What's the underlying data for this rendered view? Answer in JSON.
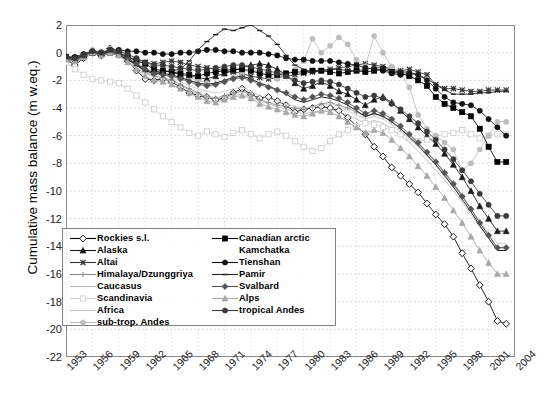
{
  "chart_data": {
    "type": "line",
    "title": "",
    "xlabel": "",
    "ylabel": "Cumulative mass balance (m w.eq.)",
    "xlim": [
      1953,
      2004
    ],
    "ylim": [
      -22,
      2
    ],
    "ytick_step": 2,
    "xtick_step": 3,
    "grid": true,
    "legend_position": "inside-lower-left",
    "xticks": [
      "1953",
      "1956",
      "1959",
      "1962",
      "1965",
      "1968",
      "1971",
      "1974",
      "1977",
      "1980",
      "1983",
      "1986",
      "1989",
      "1992",
      "1995",
      "1998",
      "2001",
      "2004"
    ],
    "yticks": [
      "2",
      "0",
      "-2",
      "-4",
      "-6",
      "-8",
      "-10",
      "-12",
      "-14",
      "-16",
      "-18",
      "-20",
      "-22"
    ],
    "x": [
      1953,
      1954,
      1955,
      1956,
      1957,
      1958,
      1959,
      1960,
      1961,
      1962,
      1963,
      1964,
      1965,
      1966,
      1967,
      1968,
      1969,
      1970,
      1971,
      1972,
      1973,
      1974,
      1975,
      1976,
      1977,
      1978,
      1979,
      1980,
      1981,
      1982,
      1983,
      1984,
      1985,
      1986,
      1987,
      1988,
      1989,
      1990,
      1991,
      1992,
      1993,
      1994,
      1995,
      1996,
      1997,
      1998,
      1999,
      2000,
      2001,
      2002,
      2003
    ],
    "series": [
      {
        "name": "Rockies s.l.",
        "marker": "diamond-open",
        "color": "#000000",
        "fill": "#ffffff",
        "values": [
          -0.5,
          -0.9,
          -0.4,
          0.1,
          -0.2,
          0.3,
          0.1,
          -0.6,
          -1.3,
          -1.9,
          -2.0,
          -1.9,
          -2.1,
          -2.5,
          -2.9,
          -3.1,
          -3.2,
          -3.4,
          -3.3,
          -2.9,
          -2.6,
          -3.0,
          -3.3,
          -3.2,
          -3.5,
          -3.8,
          -4.3,
          -4.1,
          -4.0,
          -3.9,
          -4.0,
          -4.2,
          -4.7,
          -5.3,
          -5.9,
          -6.8,
          -7.5,
          -8.3,
          -8.9,
          -9.5,
          -10.1,
          -10.9,
          -11.7,
          -12.4,
          -13.3,
          -14.5,
          -15.6,
          -16.8,
          -18.0,
          -19.4,
          -19.6
        ]
      },
      {
        "name": "Alaska",
        "marker": "triangle",
        "color": "#1a1a1a",
        "fill": "#1a1a1a",
        "values": [
          -0.3,
          -0.4,
          -0.2,
          0.0,
          -0.1,
          0.0,
          -0.1,
          -0.4,
          -0.8,
          -1.2,
          -1.4,
          -1.3,
          -1.4,
          -1.6,
          -1.7,
          -1.8,
          -1.9,
          -1.7,
          -1.5,
          -1.3,
          -1.1,
          -0.9,
          -0.8,
          -0.9,
          -1.2,
          -1.6,
          -2.2,
          -2.6,
          -2.4,
          -2.1,
          -2.4,
          -2.8,
          -3.0,
          -3.4,
          -3.8,
          -3.4,
          -3.2,
          -3.6,
          -4.2,
          -4.8,
          -5.4,
          -6.0,
          -6.6,
          -7.3,
          -8.1,
          -9.0,
          -10.0,
          -11.1,
          -12.0,
          -12.9,
          -12.9
        ]
      },
      {
        "name": "Altai",
        "marker": "x",
        "color": "#333333",
        "fill": "#333333",
        "values": [
          -0.4,
          -0.5,
          -0.3,
          0.0,
          -0.1,
          0.1,
          0.0,
          -0.3,
          -0.5,
          -0.7,
          -0.8,
          -0.7,
          -0.6,
          -0.7,
          -0.9,
          -1.0,
          -1.1,
          -1.2,
          -1.3,
          -1.4,
          -1.5,
          -1.7,
          -1.8,
          -1.9,
          -1.8,
          -1.7,
          -1.6,
          -1.5,
          -1.4,
          -1.3,
          -1.2,
          -1.1,
          -1.0,
          -0.9,
          -0.8,
          -0.9,
          -1.0,
          -1.2,
          -1.3,
          -1.2,
          -1.4,
          -1.6,
          -2.3,
          -2.6,
          -2.6,
          -2.7,
          -2.8,
          -2.8,
          -2.7,
          -2.7,
          -2.7
        ]
      },
      {
        "name": "Himalaya/Dzunggriya",
        "marker": "plus",
        "color": "#8c8c8c",
        "fill": "#8c8c8c",
        "values": [
          -0.6,
          -0.7,
          -0.4,
          -0.1,
          0.0,
          0.1,
          -0.1,
          -0.4,
          -0.9,
          -1.4,
          -1.7,
          -1.8,
          -2.0,
          -2.3,
          -2.6,
          -2.9,
          -3.2,
          -3.3,
          -3.1,
          -2.9,
          -2.8,
          -3.0,
          -3.4,
          -3.6,
          -3.8,
          -3.9,
          -4.0,
          -4.1,
          -3.9,
          -3.7,
          -3.6,
          -3.8,
          -4.0,
          -4.3,
          -4.6,
          -4.4,
          -4.6,
          -5.0,
          -5.5,
          -6.0,
          -6.6,
          -7.2,
          -7.9,
          -8.6,
          -9.4,
          -10.3,
          -11.3,
          -12.3,
          -13.2,
          -14.1,
          -14.1
        ]
      },
      {
        "name": "Caucasus",
        "marker": "none",
        "color": "#b8b8b8",
        "fill": "#b8b8b8",
        "values": [
          -0.5,
          -0.6,
          -0.3,
          0.0,
          -0.2,
          0.0,
          -0.2,
          -0.6,
          -1.1,
          -1.5,
          -1.8,
          -1.9,
          -2.1,
          -2.4,
          -2.7,
          -3.0,
          -3.2,
          -3.3,
          -3.2,
          -3.1,
          -3.0,
          -3.2,
          -3.5,
          -3.7,
          -3.9,
          -4.1,
          -4.3,
          -4.4,
          -4.3,
          -4.2,
          -4.1,
          -4.3,
          -4.5,
          -4.8,
          -5.1,
          -4.9,
          -5.1,
          -5.5,
          -6.0,
          -6.5,
          -7.1,
          -7.8,
          -8.5,
          -9.2,
          -10.0,
          -10.8,
          -11.7,
          -12.6,
          -13.4,
          -14.3,
          -14.3
        ]
      },
      {
        "name": "Scandinavia",
        "marker": "square-open",
        "color": "#d0d0d0",
        "fill": "#ffffff",
        "values": [
          -0.7,
          -1.2,
          -1.6,
          -1.9,
          -2.0,
          -2.1,
          -2.2,
          -2.6,
          -3.1,
          -3.6,
          -4.1,
          -4.6,
          -5.0,
          -5.4,
          -5.8,
          -6.0,
          -5.7,
          -5.9,
          -6.1,
          -5.8,
          -5.6,
          -5.9,
          -6.2,
          -5.9,
          -5.7,
          -6.0,
          -6.4,
          -6.8,
          -7.1,
          -6.9,
          -6.4,
          -5.9,
          -5.6,
          -5.3,
          -5.1,
          -5.2,
          -5.4,
          -5.6,
          -5.9,
          -6.1,
          -6.4,
          -6.3,
          -6.1,
          -5.9,
          -5.8,
          -5.6,
          -5.9,
          -6.2,
          -6.0,
          -5.9,
          -5.9
        ]
      },
      {
        "name": "Africa",
        "marker": "none",
        "color": "#c4c4c4",
        "fill": "#c4c4c4",
        "values": [
          -0.4,
          -0.5,
          -0.3,
          0.1,
          0.0,
          0.2,
          0.0,
          -0.3,
          -0.7,
          -1.1,
          -1.4,
          -1.6,
          -1.8,
          -2.1,
          -2.4,
          -2.6,
          -2.8,
          -2.9,
          -2.8,
          -2.6,
          -2.5,
          -2.8,
          -3.1,
          -3.3,
          -3.5,
          -3.7,
          -3.9,
          -4.0,
          -3.9,
          -3.8,
          -3.7,
          -3.9,
          -4.2,
          -4.5,
          -4.8,
          -4.6,
          -4.8,
          -5.2,
          -5.7,
          -6.2,
          -6.8,
          -7.4,
          -8.1,
          -8.8,
          -9.6,
          -10.4,
          -11.3,
          -12.2,
          -13.0,
          -13.8,
          -13.8
        ]
      },
      {
        "name": "sub-trop. Andes",
        "marker": "circle",
        "color": "#bdbdbd",
        "fill": "#bdbdbd",
        "values": [
          -0.3,
          -0.4,
          -0.1,
          0.2,
          0.1,
          0.3,
          0.1,
          -0.2,
          -0.5,
          -0.8,
          -1.0,
          -1.0,
          -1.2,
          -1.5,
          -1.8,
          -2.0,
          -2.2,
          -2.3,
          -2.1,
          -1.8,
          -1.5,
          -1.2,
          -1.4,
          -1.7,
          -1.9,
          -1.6,
          -1.2,
          -0.6,
          1.0,
          0.0,
          0.5,
          1.1,
          0.6,
          -0.5,
          -1.0,
          1.2,
          0.0,
          -1.0,
          -1.5,
          -2.5,
          -4.5,
          -5.5,
          -6.0,
          -6.5,
          -7.0,
          -8.5,
          -8.0,
          -7.0,
          -6.0,
          -5.0,
          -5.0
        ]
      },
      {
        "name": "Canadian arctic",
        "marker": "square",
        "color": "#000000",
        "fill": "#000000",
        "values": [
          -0.3,
          -0.4,
          -0.2,
          0.0,
          -0.1,
          0.1,
          0.0,
          -0.3,
          -0.6,
          -0.8,
          -1.2,
          -1.3,
          -1.4,
          -1.5,
          -1.6,
          -1.7,
          -1.5,
          -1.4,
          -1.3,
          -1.2,
          -1.2,
          -1.3,
          -1.5,
          -1.6,
          -1.6,
          -1.5,
          -1.4,
          -1.4,
          -1.3,
          -1.3,
          -1.4,
          -1.5,
          -1.4,
          -1.3,
          -1.4,
          -1.3,
          -1.2,
          -1.4,
          -1.5,
          -1.7,
          -2.0,
          -2.4,
          -3.2,
          -3.7,
          -4.0,
          -4.3,
          -4.6,
          -5.5,
          -6.8,
          -7.9,
          -7.9
        ]
      },
      {
        "name": "Kamchatka",
        "marker": "none",
        "color": "#000000",
        "fill": "#000000",
        "values": [
          -0.4,
          -0.5,
          -0.3,
          0.0,
          -0.2,
          0.0,
          -0.2,
          -0.5,
          -0.9,
          -1.3,
          -1.5,
          -1.5,
          -1.6,
          -1.8,
          -2.0,
          -2.2,
          -2.3,
          -2.2,
          -2.0,
          -1.8,
          -1.7,
          -1.9,
          -2.2,
          -2.4,
          -2.7,
          -3.0,
          -3.4,
          -3.6,
          -3.4,
          -3.2,
          -3.3,
          -3.5,
          -3.8,
          -4.2,
          -4.6,
          -4.4,
          -4.6,
          -5.0,
          -5.5,
          -6.1,
          -6.7,
          -7.4,
          -8.1,
          -8.9,
          -9.7,
          -10.6,
          -11.5,
          -12.5,
          -13.4,
          -14.3,
          -14.3
        ]
      },
      {
        "name": "Tienshan",
        "marker": "circle",
        "color": "#111111",
        "fill": "#111111",
        "values": [
          -0.3,
          -0.3,
          -0.1,
          0.1,
          0.0,
          0.2,
          0.2,
          0.1,
          0.1,
          0.0,
          0.0,
          -0.1,
          -0.1,
          0.0,
          0.0,
          0.1,
          0.2,
          0.2,
          0.1,
          0.1,
          0.0,
          0.0,
          0.0,
          -0.1,
          -0.2,
          -0.4,
          -0.5,
          -0.5,
          -0.6,
          -0.6,
          -0.6,
          -0.7,
          -0.8,
          -0.9,
          -1.1,
          -1.2,
          -1.3,
          -1.5,
          -1.6,
          -1.5,
          -1.6,
          -2.0,
          -2.6,
          -3.2,
          -3.6,
          -3.7,
          -3.8,
          -4.2,
          -4.8,
          -5.4,
          -6.0
        ]
      },
      {
        "name": "Pamir",
        "marker": "dash",
        "color": "#222222",
        "fill": "#222222",
        "values": [
          -0.5,
          -0.6,
          -0.3,
          0.0,
          -0.2,
          0.0,
          -0.2,
          -0.5,
          -0.9,
          -1.3,
          -1.5,
          -1.4,
          -1.3,
          -1.2,
          -0.6,
          0.2,
          0.8,
          1.3,
          1.7,
          1.6,
          1.8,
          2.0,
          1.6,
          1.2,
          0.6,
          -0.2,
          -0.9,
          -1.2,
          -1.4,
          -1.3,
          -1.2,
          -1.2,
          -1.3,
          -1.3,
          -1.2,
          -1.1,
          -1.1,
          -1.3,
          -1.4,
          -1.4,
          -1.6,
          -1.9,
          -2.3,
          -2.7,
          -3.0,
          -3.0,
          -3.0,
          -2.9,
          -2.9,
          -2.8,
          -2.8
        ]
      },
      {
        "name": "Svalbard",
        "marker": "diamond",
        "color": "#555555",
        "fill": "#555555",
        "values": [
          -0.4,
          -0.5,
          -0.2,
          0.1,
          0.0,
          0.1,
          -0.1,
          -0.4,
          -0.8,
          -1.2,
          -1.5,
          -1.6,
          -1.7,
          -1.9,
          -2.1,
          -2.3,
          -2.4,
          -2.3,
          -2.1,
          -1.9,
          -1.8,
          -2.0,
          -2.3,
          -2.5,
          -2.7,
          -2.9,
          -3.2,
          -3.4,
          -3.2,
          -3.0,
          -3.1,
          -3.3,
          -3.6,
          -4.0,
          -4.4,
          -4.2,
          -4.4,
          -4.8,
          -5.3,
          -5.9,
          -6.5,
          -7.2,
          -7.9,
          -8.7,
          -9.5,
          -10.4,
          -11.3,
          -12.3,
          -13.2,
          -14.1,
          -14.1
        ]
      },
      {
        "name": "Alps",
        "marker": "triangle",
        "color": "#a8a8a8",
        "fill": "#a8a8a8",
        "values": [
          -0.5,
          -0.6,
          -0.3,
          0.0,
          -0.2,
          0.0,
          -0.2,
          -0.7,
          -1.2,
          -1.7,
          -2.0,
          -2.1,
          -2.3,
          -2.6,
          -2.9,
          -3.2,
          -3.5,
          -3.6,
          -3.4,
          -3.2,
          -3.1,
          -3.3,
          -3.7,
          -3.9,
          -4.1,
          -4.3,
          -4.5,
          -4.6,
          -4.4,
          -4.2,
          -4.3,
          -4.6,
          -5.0,
          -5.4,
          -5.8,
          -5.6,
          -5.8,
          -6.3,
          -6.9,
          -7.5,
          -8.2,
          -8.9,
          -9.7,
          -10.5,
          -11.4,
          -12.3,
          -13.3,
          -14.3,
          -15.2,
          -16.0,
          -16.0
        ]
      },
      {
        "name": "tropical Andes",
        "marker": "circle",
        "color": "#3a3a3a",
        "fill": "#3a3a3a",
        "values": [
          -0.3,
          -0.4,
          -0.2,
          0.1,
          0.0,
          0.2,
          0.1,
          -0.1,
          -0.4,
          -0.7,
          -0.9,
          -0.9,
          -1.0,
          -1.1,
          -1.2,
          -1.3,
          -1.2,
          -1.1,
          -1.0,
          -0.9,
          -0.9,
          -1.0,
          -1.2,
          -1.3,
          -1.5,
          -1.7,
          -2.0,
          -2.2,
          -2.1,
          -2.0,
          -2.1,
          -2.3,
          -2.6,
          -2.9,
          -3.2,
          -3.1,
          -3.3,
          -3.7,
          -4.1,
          -4.6,
          -5.1,
          -5.7,
          -6.3,
          -7.0,
          -7.7,
          -8.5,
          -9.3,
          -10.2,
          -11.0,
          -11.8,
          -11.8
        ]
      }
    ]
  },
  "legend": {
    "left_items": [
      {
        "label": "Rockies s.l.",
        "key": "diamond-open",
        "color": "#000000",
        "fill": "#ffffff"
      },
      {
        "label": "Alaska",
        "key": "triangle",
        "color": "#1a1a1a",
        "fill": "#1a1a1a"
      },
      {
        "label": "Altai",
        "key": "x",
        "color": "#333333",
        "fill": "#333333"
      },
      {
        "label": "Himalaya/Dzunggriya",
        "key": "plus",
        "color": "#8c8c8c",
        "fill": "#8c8c8c"
      },
      {
        "label": "Caucasus",
        "key": "none",
        "color": "#b8b8b8",
        "fill": "#b8b8b8"
      },
      {
        "label": "Scandinavia",
        "key": "square-open",
        "color": "#d0d0d0",
        "fill": "#ffffff"
      },
      {
        "label": "Africa",
        "key": "none",
        "color": "#c4c4c4",
        "fill": "#c4c4c4"
      },
      {
        "label": "sub-trop. Andes",
        "key": "circle",
        "color": "#bdbdbd",
        "fill": "#bdbdbd"
      }
    ],
    "right_items": [
      {
        "label": "Canadian arctic",
        "key": "square",
        "color": "#000000",
        "fill": "#000000"
      },
      {
        "label": "Kamchatka",
        "key": "none-blank",
        "color": "#000000",
        "fill": "#000000"
      },
      {
        "label": "Tienshan",
        "key": "circle",
        "color": "#111111",
        "fill": "#111111"
      },
      {
        "label": "Pamir",
        "key": "dash",
        "color": "#222222",
        "fill": "#222222"
      },
      {
        "label": "Svalbard",
        "key": "diamond",
        "color": "#555555",
        "fill": "#555555"
      },
      {
        "label": "Alps",
        "key": "triangle",
        "color": "#a8a8a8",
        "fill": "#a8a8a8"
      },
      {
        "label": "tropical Andes",
        "key": "circle",
        "color": "#3a3a3a",
        "fill": "#3a3a3a"
      }
    ]
  }
}
